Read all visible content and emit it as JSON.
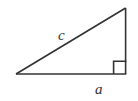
{
  "figure": {
    "type": "right-triangle-diagram",
    "background_color": "#ffffff",
    "stroke_color": "#333333",
    "stroke_width": 1.5,
    "canvas": {
      "width": 138,
      "height": 101
    },
    "vertices": {
      "left": {
        "x": 16,
        "y": 74
      },
      "bottom_right": {
        "x": 126,
        "y": 74
      },
      "apex": {
        "x": 125.5,
        "y": 8
      }
    },
    "sides": {
      "base": {
        "from": "left",
        "to": "bottom_right",
        "label": "a"
      },
      "vertical": {
        "from": "bottom_right",
        "to": "apex",
        "label": ""
      },
      "hypotenuse": {
        "from": "left",
        "to": "apex",
        "label": "c"
      }
    },
    "right_angle_marker": {
      "at_vertex": "bottom_right",
      "x": 114,
      "y": 61,
      "size": 12.5,
      "shown": true
    },
    "labels": {
      "hypotenuse": "c",
      "base": "a"
    }
  }
}
